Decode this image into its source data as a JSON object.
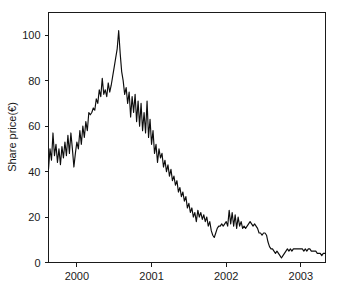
{
  "chart_data": {
    "type": "line",
    "title": "",
    "xlabel": "",
    "ylabel": "Share price(€)",
    "xlim": [
      1999.62,
      2003.33
    ],
    "ylim": [
      0,
      110
    ],
    "grid": false,
    "legend": null,
    "y_ticks": [
      0,
      20,
      40,
      60,
      80,
      100
    ],
    "y_tick_labels": [
      "0",
      "20",
      "40",
      "60",
      "80",
      "100"
    ],
    "x_ticks": [
      2000,
      2001,
      2002,
      2003
    ],
    "x_tick_labels": [
      "2000",
      "2001",
      "2002",
      "2003"
    ],
    "series": [
      {
        "name": "Share price",
        "color": "#0d0d0d",
        "x": [
          1999.62,
          1999.64,
          1999.66,
          1999.68,
          1999.7,
          1999.72,
          1999.74,
          1999.76,
          1999.78,
          1999.8,
          1999.82,
          1999.84,
          1999.86,
          1999.88,
          1999.9,
          1999.92,
          1999.94,
          1999.96,
          1999.98,
          2000.0,
          2000.02,
          2000.04,
          2000.06,
          2000.08,
          2000.1,
          2000.12,
          2000.14,
          2000.16,
          2000.18,
          2000.2,
          2000.22,
          2000.24,
          2000.26,
          2000.28,
          2000.3,
          2000.32,
          2000.34,
          2000.36,
          2000.38,
          2000.4,
          2000.42,
          2000.44,
          2000.46,
          2000.48,
          2000.5,
          2000.52,
          2000.54,
          2000.56,
          2000.58,
          2000.6,
          2000.62,
          2000.64,
          2000.66,
          2000.68,
          2000.7,
          2000.72,
          2000.74,
          2000.76,
          2000.78,
          2000.8,
          2000.82,
          2000.84,
          2000.86,
          2000.88,
          2000.9,
          2000.92,
          2000.94,
          2000.96,
          2000.98,
          2001.0,
          2001.02,
          2001.04,
          2001.06,
          2001.08,
          2001.1,
          2001.12,
          2001.14,
          2001.16,
          2001.18,
          2001.2,
          2001.22,
          2001.24,
          2001.26,
          2001.28,
          2001.3,
          2001.32,
          2001.34,
          2001.36,
          2001.38,
          2001.4,
          2001.42,
          2001.44,
          2001.46,
          2001.48,
          2001.5,
          2001.52,
          2001.54,
          2001.56,
          2001.58,
          2001.6,
          2001.62,
          2001.64,
          2001.66,
          2001.68,
          2001.7,
          2001.72,
          2001.74,
          2001.76,
          2001.78,
          2001.8,
          2001.82,
          2001.84,
          2001.86,
          2001.88,
          2001.9,
          2001.92,
          2001.94,
          2001.96,
          2001.98,
          2002.0,
          2002.02,
          2002.04,
          2002.06,
          2002.08,
          2002.1,
          2002.12,
          2002.14,
          2002.16,
          2002.18,
          2002.2,
          2002.22,
          2002.24,
          2002.26,
          2002.28,
          2002.3,
          2002.32,
          2002.34,
          2002.36,
          2002.38,
          2002.4,
          2002.42,
          2002.44,
          2002.46,
          2002.48,
          2002.5,
          2002.52,
          2002.54,
          2002.56,
          2002.58,
          2002.6,
          2002.62,
          2002.64,
          2002.66,
          2002.68,
          2002.7,
          2002.72,
          2002.74,
          2002.76,
          2002.78,
          2002.8,
          2002.82,
          2002.84,
          2002.86,
          2002.88,
          2002.9,
          2002.92,
          2002.94,
          2002.96,
          2002.98,
          2003.0,
          2003.02,
          2003.04,
          2003.06,
          2003.08,
          2003.1,
          2003.12,
          2003.14,
          2003.16,
          2003.18,
          2003.2,
          2003.22,
          2003.24,
          2003.26,
          2003.28,
          2003.3,
          2003.33
        ],
        "y": [
          41,
          50,
          45,
          57,
          47,
          52,
          44,
          50,
          43,
          51,
          46,
          53,
          47,
          56,
          48,
          57,
          50,
          42,
          48,
          53,
          50,
          58,
          52,
          60,
          55,
          62,
          58,
          66,
          65,
          66,
          68,
          67,
          72,
          70,
          76,
          73,
          81,
          74,
          76,
          73,
          79,
          75,
          78,
          82,
          86,
          90,
          94,
          102,
          92,
          84,
          80,
          74,
          77,
          70,
          75,
          64,
          73,
          66,
          74,
          62,
          71,
          60,
          70,
          58,
          66,
          57,
          71,
          55,
          63,
          52,
          58,
          48,
          52,
          44,
          50,
          46,
          48,
          42,
          45,
          40,
          43,
          38,
          41,
          36,
          38,
          34,
          36,
          31,
          33,
          29,
          31,
          27,
          29,
          24,
          26,
          22,
          24,
          20,
          22,
          18,
          23,
          20,
          22,
          19,
          21,
          18,
          20,
          16,
          18,
          14,
          12,
          11,
          13,
          15,
          16,
          16,
          17,
          16,
          17,
          18,
          16,
          23,
          17,
          22,
          16,
          21,
          15,
          20,
          16,
          18,
          15,
          16,
          15,
          16,
          17,
          18,
          17,
          16,
          17,
          16,
          15,
          13,
          13,
          12,
          13,
          13,
          12,
          9,
          7,
          6,
          6,
          5,
          4,
          5,
          4,
          3,
          2,
          3,
          4,
          5,
          6,
          5,
          6,
          5,
          6,
          6,
          6,
          6,
          6,
          6,
          6,
          5,
          6,
          5,
          6,
          6,
          5,
          5,
          5,
          5,
          4,
          4,
          4,
          3,
          4,
          4
        ]
      }
    ]
  },
  "axis": {
    "y_title": "Share price(€)"
  }
}
